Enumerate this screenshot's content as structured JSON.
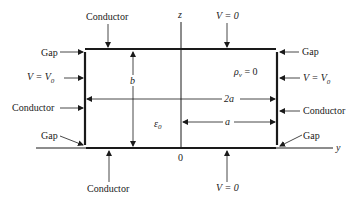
{
  "labels": {
    "conductor_top": "Conductor",
    "conductor_bottom": "Conductor",
    "conductor_left": "Conductor",
    "conductor_right": "Conductor",
    "gap_top_left": "Gap",
    "gap_top_right": "Gap",
    "gap_bottom_left": "Gap",
    "gap_bottom_right": "Gap",
    "v_top": "V = 0",
    "v_bottom": "V = 0",
    "v_left_main": "V = V",
    "v_left_sub": "0",
    "v_right_main": "V = V",
    "v_right_sub": "0",
    "rho_main": "ρ",
    "rho_sub": "v",
    "rho_eq": " = 0",
    "eps_main": "ε",
    "eps_sub": "0",
    "dim_b": "b",
    "dim_2a": "2a",
    "dim_a": "a",
    "axis_z": "z",
    "axis_y": "y",
    "origin": "0"
  },
  "colors": {
    "line": "#1a1a1a",
    "background": "#ffffff"
  }
}
